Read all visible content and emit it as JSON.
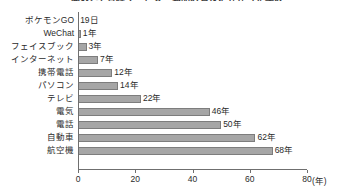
{
  "chart_data": {
    "type": "bar",
    "orientation": "horizontal",
    "title": "図表2-1 各種サービス・製品の普及にかかった年数",
    "xlabel": "(年)",
    "ylabel": "",
    "xlim": [
      0,
      80
    ],
    "xticks": [
      0,
      20,
      40,
      60,
      80
    ],
    "xtick_labels": [
      "0",
      "20",
      "40",
      "60",
      "80"
    ],
    "grid": false,
    "legend": null,
    "categories": [
      "ポケモンGO",
      "WeChat",
      "フェイスブック",
      "インターネット",
      "携帯電話",
      "パソコン",
      "テレビ",
      "電気",
      "電話",
      "自動車",
      "航空機"
    ],
    "values": [
      0.05,
      1,
      3,
      7,
      12,
      14,
      22,
      46,
      50,
      62,
      68
    ],
    "value_labels": [
      "19日",
      "1年",
      "3年",
      "7年",
      "12年",
      "14年",
      "22年",
      "46年",
      "50年",
      "62年",
      "68年"
    ]
  },
  "axis": {
    "unit_label": "(年)"
  },
  "colors": {
    "bar_fill": "#a6a6a6",
    "bar_stroke": "#7d7d7d",
    "axis": "#6f6f6f",
    "text": "#2b2b2b",
    "background": "#ffffff"
  }
}
